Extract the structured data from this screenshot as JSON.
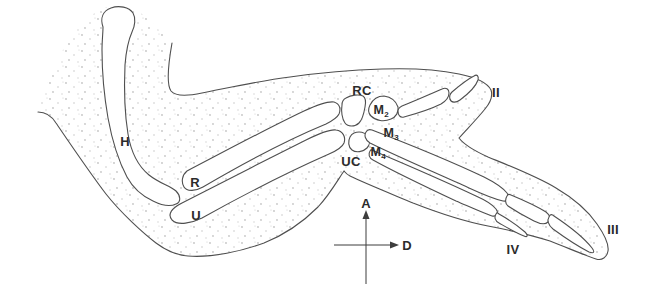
{
  "figure": {
    "kind": "anatomical line drawing of a forelimb/wing skeleton with stippled flesh outline",
    "bone_labels": [
      {
        "id": "humerus",
        "text": "H"
      },
      {
        "id": "radius",
        "text": "R"
      },
      {
        "id": "ulna",
        "text": "U"
      },
      {
        "id": "radial-carpal",
        "text": "RC"
      },
      {
        "id": "ulnar-carpal",
        "text": "UC"
      },
      {
        "id": "metacarpal-2",
        "text": "M",
        "sub": "2"
      },
      {
        "id": "metacarpal-3",
        "text": "M",
        "sub": "3"
      },
      {
        "id": "metacarpal-4",
        "text": "M",
        "sub": "4"
      },
      {
        "id": "digit-2",
        "text": "II"
      },
      {
        "id": "digit-3",
        "text": "III"
      },
      {
        "id": "digit-4",
        "text": "IV"
      }
    ],
    "axis_labels": [
      {
        "id": "anterior",
        "text": "A"
      },
      {
        "id": "distal",
        "text": "D"
      }
    ],
    "colors": {
      "background": "#ffffff",
      "line": "#4f4f4f",
      "text": "#2b2b2b",
      "stipple": "#c3c3c3"
    }
  }
}
